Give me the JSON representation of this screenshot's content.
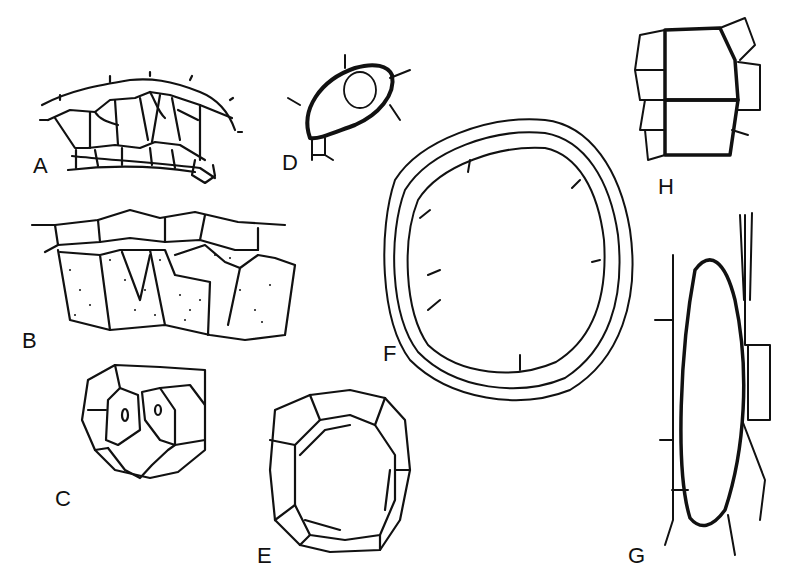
{
  "figure": {
    "panels": [
      {
        "id": "A",
        "label": "A",
        "description": "Arc of polygonal cells (tissue section)"
      },
      {
        "id": "B",
        "label": "B",
        "description": "Cell layer with stippled (granular) inner cells"
      },
      {
        "id": "C",
        "label": "C",
        "description": "Group of cells with stippled cells containing nuclei"
      },
      {
        "id": "D",
        "label": "D",
        "description": "Single thick-walled cell with round inclusion"
      },
      {
        "id": "E",
        "label": "E",
        "description": "Ring of cells surrounding a lumen"
      },
      {
        "id": "F",
        "label": "F",
        "description": "Large ring of multilayered cells"
      },
      {
        "id": "G",
        "label": "G",
        "description": "Elongated thick-walled cell flanked by cells"
      },
      {
        "id": "H",
        "label": "H",
        "description": "Two stacked thick-walled cells with neighbors"
      }
    ],
    "colors": {
      "ink": "#111111",
      "background": "#ffffff"
    }
  }
}
